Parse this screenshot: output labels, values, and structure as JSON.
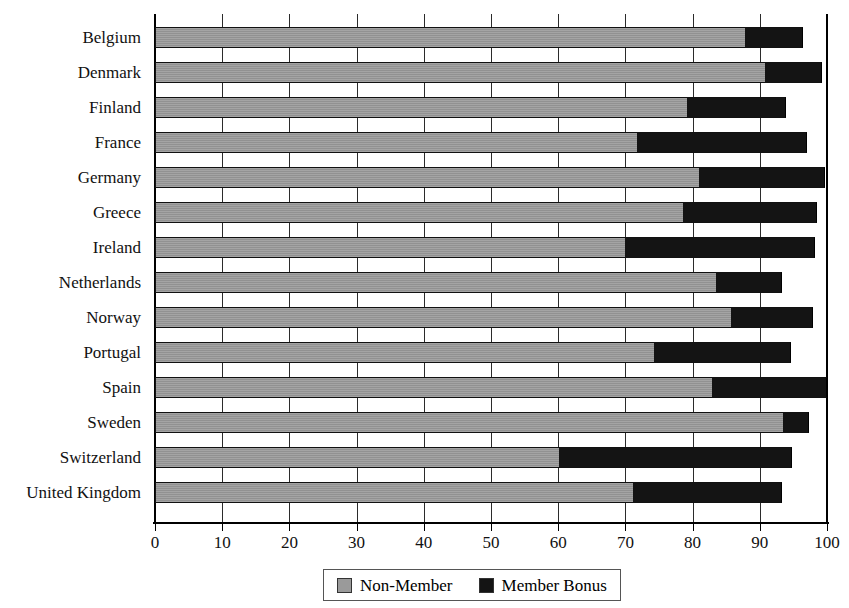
{
  "chart_data": {
    "type": "bar",
    "orientation": "horizontal",
    "stacked": true,
    "title": "",
    "xlabel": "",
    "ylabel": "",
    "xlim": [
      0,
      100
    ],
    "xticks": [
      0,
      10,
      20,
      30,
      40,
      50,
      60,
      70,
      80,
      90,
      100
    ],
    "grid": true,
    "grid_axis": "x",
    "legend_position": "bottom",
    "categories": [
      "Belgium",
      "Denmark",
      "Finland",
      "France",
      "Germany",
      "Greece",
      "Ireland",
      "Netherlands",
      "Norway",
      "Portugal",
      "Spain",
      "Sweden",
      "Switzerland",
      "United Kingdom"
    ],
    "series": [
      {
        "name": "Non-Member",
        "color": "#9a9a9a",
        "values": [
          87.8,
          90.8,
          79.2,
          71.7,
          81.0,
          78.6,
          70.0,
          83.5,
          85.7,
          74.3,
          82.9,
          93.5,
          60.1,
          71.1
        ]
      },
      {
        "name": "Member Bonus",
        "color": "#141414",
        "values": [
          8.6,
          8.5,
          14.7,
          25.3,
          18.7,
          19.9,
          28.2,
          9.8,
          12.2,
          20.3,
          17.1,
          3.8,
          34.7,
          22.2
        ]
      }
    ],
    "totals": [
      96.4,
      99.3,
      93.9,
      97.0,
      99.7,
      98.5,
      98.2,
      93.3,
      97.9,
      94.6,
      100.0,
      97.3,
      94.8,
      93.3
    ]
  },
  "legend": {
    "entries": [
      {
        "label": "Non-Member",
        "swatch": "swatch-nonmember"
      },
      {
        "label": "Member Bonus",
        "swatch": "swatch-bonus"
      }
    ]
  },
  "colors": {
    "non_member": "#9a9a9a",
    "member_bonus": "#141414",
    "axis": "#000000",
    "grid": "#2b2b2b",
    "background": "#ffffff"
  }
}
